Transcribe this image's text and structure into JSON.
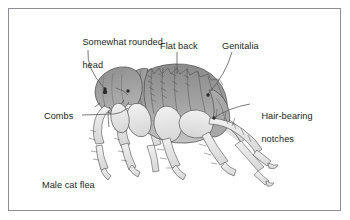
{
  "figure": {
    "caption": "Male cat flea",
    "border_color": "#8d8d93",
    "background_color": "#ffffff",
    "text_color": "#231f20",
    "line_color": "#58595b"
  },
  "labels": {
    "head_line1": "Somewhat rounded",
    "head_line2": "head",
    "flat_back": "Flat back",
    "genitalia": "Genitalia",
    "combs": "Combs",
    "hair_line1": "Hair-bearing",
    "hair_line2": "notches"
  },
  "specimen": {
    "name": "Male cat flea",
    "body_fill": "#9b9b9b",
    "head_fill": "#8f8f8f",
    "leg_fill": "#e3e3e3",
    "outline": "#4d4d4f",
    "parts": [
      "head",
      "thorax",
      "abdomen",
      "genital-segment",
      "genal-comb",
      "pronotal-comb",
      "foreleg",
      "midleg",
      "hindleg",
      "antenna",
      "eye"
    ]
  }
}
